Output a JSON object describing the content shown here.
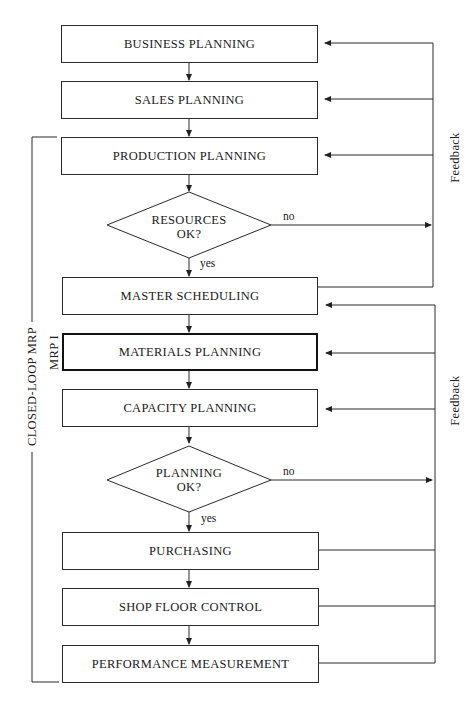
{
  "diagram": {
    "boxes": [
      {
        "id": "business",
        "label": "BUSINESS PLANNING"
      },
      {
        "id": "sales",
        "label": "SALES PLANNING"
      },
      {
        "id": "production",
        "label": "PRODUCTION PLANNING"
      },
      {
        "id": "master",
        "label": "MASTER SCHEDULING"
      },
      {
        "id": "materials",
        "label": "MATERIALS PLANNING"
      },
      {
        "id": "capacity",
        "label": "CAPACITY PLANNING"
      },
      {
        "id": "purchasing",
        "label": "PURCHASING"
      },
      {
        "id": "shopfloor",
        "label": "SHOP FLOOR CONTROL"
      },
      {
        "id": "performance",
        "label": "PERFORMANCE MEASUREMENT"
      }
    ],
    "decisions": [
      {
        "id": "resources",
        "line1": "RESOURCES",
        "line2": "OK?",
        "yes": "yes",
        "no": "no"
      },
      {
        "id": "planning",
        "line1": "PLANNING",
        "line2": "OK?",
        "yes": "yes",
        "no": "no"
      }
    ],
    "side_labels": {
      "closed_loop": "CLOSED-LOOP MRP",
      "mrp1": "MRP I",
      "feedback_upper": "Feedback",
      "feedback_lower": "Feedback"
    }
  }
}
